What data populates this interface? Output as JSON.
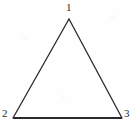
{
  "figure": {
    "kind": "geometry-figure",
    "shape": "triangle",
    "canvas": {
      "width": 138,
      "height": 125
    },
    "background_color": "#fefefe",
    "ink_color": "#2a2a2e",
    "vertices": [
      {
        "id": "apex",
        "label": "1",
        "x": 69,
        "y": 19,
        "label_x": 66,
        "label_y": 2
      },
      {
        "id": "bottom-left",
        "label": "2",
        "x": 13,
        "y": 118,
        "label_x": 2,
        "label_y": 108
      },
      {
        "id": "bottom-right",
        "label": "3",
        "x": 122,
        "y": 118,
        "label_x": 124,
        "label_y": 108
      }
    ],
    "edges": [
      {
        "id": "left-side",
        "from": "apex",
        "to": "bottom-left",
        "stroke_width": 1.3
      },
      {
        "id": "right-side",
        "from": "apex",
        "to": "bottom-right",
        "stroke_width": 1.3
      },
      {
        "id": "base",
        "from": "bottom-left",
        "to": "bottom-right",
        "stroke_width": 2.1
      }
    ],
    "fill": "none"
  }
}
